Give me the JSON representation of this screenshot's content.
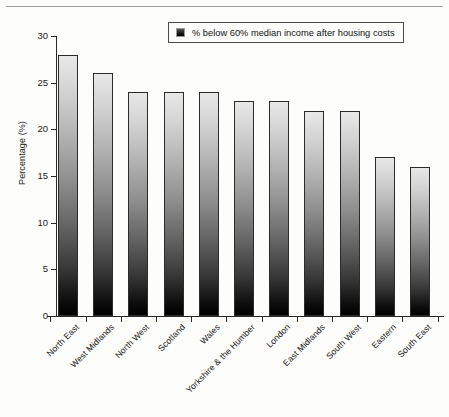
{
  "chart_data": {
    "type": "bar",
    "title": "",
    "xlabel": "",
    "ylabel": "Percentage (%)",
    "ylim": [
      0,
      30
    ],
    "ytick_step": 5,
    "yticks": [
      0,
      5,
      10,
      15,
      20,
      25,
      30
    ],
    "ytick_labels": [
      "0",
      "5",
      "10",
      "15",
      "20",
      "25",
      "30"
    ],
    "grid": false,
    "legend_position": "top-right",
    "categories": [
      "North East",
      "West Midlands",
      "North West",
      "Scotland",
      "Wales",
      "Yorkshire & the Humber",
      "London",
      "East Midlands",
      "South West",
      "Eastern",
      "South East"
    ],
    "series": [
      {
        "name": "% below 60% median income after housing costs",
        "values": [
          28,
          26,
          24,
          24,
          24,
          23,
          23,
          22,
          22,
          17,
          16
        ]
      }
    ],
    "legend": [
      "% below 60% median income after housing costs"
    ],
    "bar_style": {
      "fill": "vertical-gradient-light-to-black",
      "top_color": "#e8e8e8",
      "bottom_color": "#000000",
      "border_color": "#2b2b2b"
    }
  },
  "axis": {
    "y_title": "Percentage (%)",
    "line_color": "#2a2a2a"
  },
  "legend_box": {
    "label": "% below 60% median income after housing costs",
    "swatch_name": "legend-swatch-square"
  },
  "page": {
    "background": "#fdfdfb",
    "rule_color": "#8d8d8d"
  }
}
